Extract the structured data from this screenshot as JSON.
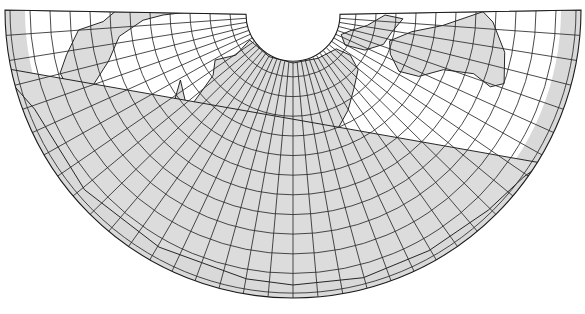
{
  "map": {
    "title": "Conic projection world map (north polar opening, southern hemisphere below)",
    "projection": "conic",
    "canvas": {
      "width": 585,
      "height": 314
    },
    "center": {
      "x": 293,
      "y": 15
    },
    "inner_radius": 47,
    "outer_radius": 288,
    "parallel_spacing_px": 20,
    "meridian_count": 36,
    "fan_start_deg": -1,
    "fan_end_deg": 181,
    "outer_band_width_px": 20,
    "colors": {
      "land": "#dcdcdc",
      "ocean": "#ffffff",
      "band": "#d9d9d9",
      "grid": "#2a2a2a",
      "coast": "#111111"
    },
    "regions": [
      "North America",
      "Greenland",
      "Europe",
      "Africa",
      "Asia",
      "India",
      "Southeast Asia",
      "Australia",
      "New Zealand",
      "Antarctica",
      "South America"
    ]
  }
}
